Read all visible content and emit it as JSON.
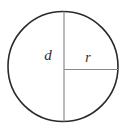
{
  "figure": {
    "name": "circle-diameter-radius-diagram",
    "type": "geometry-diagram",
    "background_color": "#ffffff",
    "canvas": {
      "width": 131,
      "height": 131
    },
    "circle": {
      "name": "circle-outline",
      "center_x": 63,
      "center_y": 66.5,
      "radius": 55,
      "stroke_color": "#2a2a2a",
      "stroke_width": 1.6,
      "fill": "none"
    },
    "segments": [
      {
        "name": "diameter-line",
        "orientation": "vertical",
        "x1": 64,
        "y1": 11.5,
        "x2": 64,
        "y2": 121.5,
        "stroke_color": "#8a8a8a",
        "stroke_width": 1.2,
        "represents": "diameter"
      },
      {
        "name": "radius-line",
        "orientation": "horizontal",
        "x1": 64,
        "y1": 69.5,
        "x2": 118,
        "y2": 69.5,
        "stroke_color": "#8a8a8a",
        "stroke_width": 1.2,
        "represents": "radius"
      }
    ],
    "labels": [
      {
        "name": "diameter-label",
        "text": "d",
        "x": 48,
        "y": 60,
        "font_size": 15,
        "color": "#2b2b2b",
        "style": "italic",
        "describes": "diameter"
      },
      {
        "name": "radius-label",
        "text": "r",
        "x": 88,
        "y": 62,
        "font_size": 14,
        "color": "#2b2b2b",
        "style": "italic",
        "describes": "radius"
      }
    ]
  }
}
